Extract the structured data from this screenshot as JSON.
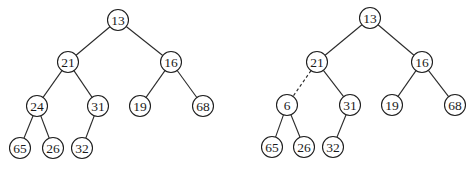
{
  "diagram": {
    "type": "binary-heap-trees",
    "node_radius": 10.5,
    "colors": {
      "line": "#2a2a2a",
      "node_fill": "#ffffff",
      "text": "#1a1a1a"
    },
    "trees": [
      {
        "id": "left",
        "nodes": [
          {
            "id": "n13",
            "label": "13",
            "x": 118,
            "y": 20
          },
          {
            "id": "n21",
            "label": "21",
            "x": 68,
            "y": 62
          },
          {
            "id": "n16",
            "label": "16",
            "x": 171,
            "y": 62
          },
          {
            "id": "n24",
            "label": "24",
            "x": 37,
            "y": 106
          },
          {
            "id": "n31",
            "label": "31",
            "x": 98,
            "y": 106
          },
          {
            "id": "n19",
            "label": "19",
            "x": 140,
            "y": 106
          },
          {
            "id": "n68",
            "label": "68",
            "x": 203,
            "y": 106
          },
          {
            "id": "n65",
            "label": "65",
            "x": 20,
            "y": 148
          },
          {
            "id": "n26",
            "label": "26",
            "x": 53,
            "y": 148
          },
          {
            "id": "n32",
            "label": "32",
            "x": 82,
            "y": 148
          }
        ],
        "edges": [
          {
            "from": "n13",
            "to": "n21",
            "style": "solid"
          },
          {
            "from": "n13",
            "to": "n16",
            "style": "solid"
          },
          {
            "from": "n21",
            "to": "n24",
            "style": "solid"
          },
          {
            "from": "n21",
            "to": "n31",
            "style": "solid"
          },
          {
            "from": "n16",
            "to": "n19",
            "style": "solid"
          },
          {
            "from": "n16",
            "to": "n68",
            "style": "solid"
          },
          {
            "from": "n24",
            "to": "n65",
            "style": "solid"
          },
          {
            "from": "n24",
            "to": "n26",
            "style": "solid"
          },
          {
            "from": "n31",
            "to": "n32",
            "style": "solid"
          }
        ]
      },
      {
        "id": "right",
        "nodes": [
          {
            "id": "m13",
            "label": "13",
            "x": 370,
            "y": 18
          },
          {
            "id": "m21",
            "label": "21",
            "x": 317,
            "y": 62
          },
          {
            "id": "m16",
            "label": "16",
            "x": 422,
            "y": 62
          },
          {
            "id": "m6",
            "label": "6",
            "x": 287,
            "y": 105
          },
          {
            "id": "m31",
            "label": "31",
            "x": 350,
            "y": 105
          },
          {
            "id": "m19",
            "label": "19",
            "x": 392,
            "y": 105
          },
          {
            "id": "m68",
            "label": "68",
            "x": 455,
            "y": 105
          },
          {
            "id": "m65",
            "label": "65",
            "x": 272,
            "y": 147
          },
          {
            "id": "m26",
            "label": "26",
            "x": 304,
            "y": 147
          },
          {
            "id": "m32",
            "label": "32",
            "x": 333,
            "y": 147
          }
        ],
        "edges": [
          {
            "from": "m13",
            "to": "m21",
            "style": "solid"
          },
          {
            "from": "m13",
            "to": "m16",
            "style": "solid"
          },
          {
            "from": "m21",
            "to": "m6",
            "style": "dashed"
          },
          {
            "from": "m21",
            "to": "m31",
            "style": "solid"
          },
          {
            "from": "m16",
            "to": "m19",
            "style": "solid"
          },
          {
            "from": "m16",
            "to": "m68",
            "style": "solid"
          },
          {
            "from": "m6",
            "to": "m65",
            "style": "solid"
          },
          {
            "from": "m6",
            "to": "m26",
            "style": "solid"
          },
          {
            "from": "m31",
            "to": "m32",
            "style": "solid"
          }
        ]
      }
    ]
  }
}
